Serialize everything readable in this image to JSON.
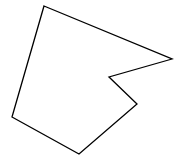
{
  "diagram": {
    "type": "polygon",
    "shape": "concave-hexagon",
    "background": "#ffffff",
    "stroke": "#000000",
    "fill": "none",
    "stroke_width": 1.3,
    "vertices": [
      [
        44,
        6
      ],
      [
        172,
        59
      ],
      [
        109,
        77
      ],
      [
        137,
        104
      ],
      [
        79,
        154
      ],
      [
        12,
        117
      ]
    ]
  }
}
